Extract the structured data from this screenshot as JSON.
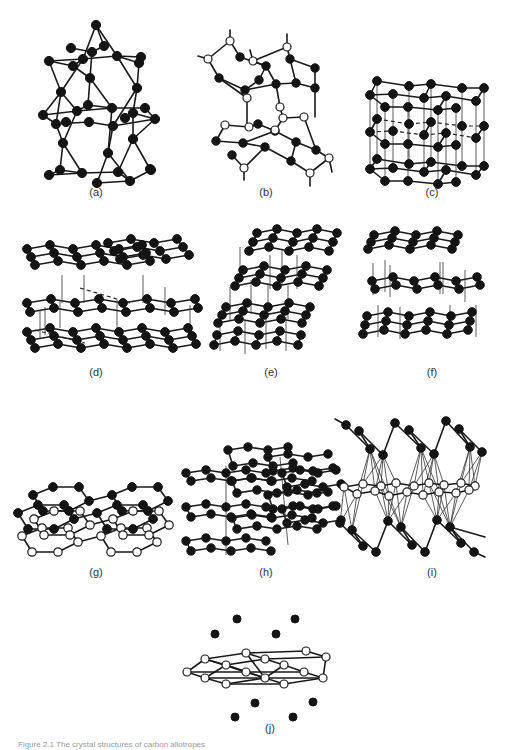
{
  "figure": {
    "caption": "Figure 2.1  The crystal structures of carbon allotropes",
    "panels": [
      {
        "id": "a",
        "label": "(a)",
        "atoms": "filled",
        "motif": "tetrahedral-stack"
      },
      {
        "id": "b",
        "label": "(b)",
        "atoms": "mixed",
        "motif": "puckered-layers-with-bridges"
      },
      {
        "id": "c",
        "label": "(c)",
        "atoms": "filled",
        "motif": "cubic-lattice"
      },
      {
        "id": "d",
        "label": "(d)",
        "atoms": "filled",
        "motif": "hexagonal-layers-wide"
      },
      {
        "id": "e",
        "label": "(e)",
        "atoms": "filled",
        "motif": "hexagonal-layers-slanted"
      },
      {
        "id": "f",
        "label": "(f)",
        "atoms": "filled",
        "motif": "hexagonal-layers-stacked"
      },
      {
        "id": "g",
        "label": "(g)",
        "atoms": "mixed",
        "motif": "graphite-bilayer"
      },
      {
        "id": "h",
        "label": "(h)",
        "atoms": "filled",
        "motif": "zigzag-chains"
      },
      {
        "id": "i",
        "label": "(i)",
        "atoms": "mixed",
        "motif": "intercalated-layer"
      },
      {
        "id": "j",
        "label": "(j)",
        "atoms": "mixed",
        "motif": "sheet-with-ions"
      }
    ]
  },
  "colors": {
    "filled_atom": "#141414",
    "open_atom": "#ffffff",
    "bond": "#1a1a1a",
    "label_text": "#333333",
    "background": "#ffffff"
  }
}
